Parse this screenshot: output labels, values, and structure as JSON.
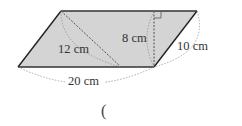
{
  "figure": {
    "shape": "parallelogram",
    "fill_color": "#d4d4d4",
    "stroke_color": "#222222",
    "labels": {
      "diagonal": "12 cm",
      "height": "8 cm",
      "side": "10 cm",
      "base": "20 cm"
    }
  },
  "answer": {
    "open_paren": "("
  }
}
